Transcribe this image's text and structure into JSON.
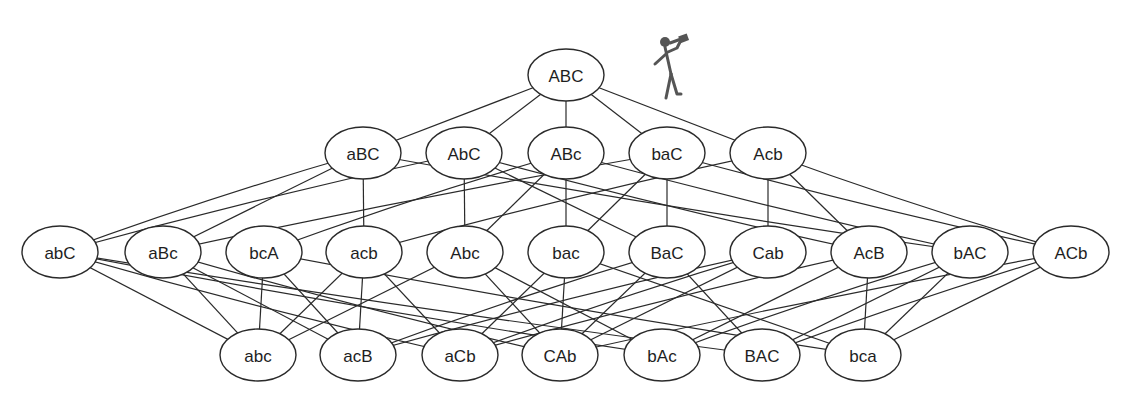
{
  "diagram": {
    "type": "lattice",
    "node_rx": 38,
    "node_ry": 26,
    "colors": {
      "stroke": "#2a2a2a",
      "fill": "#ffffff",
      "text": "#1e1e1e",
      "figure": "#555555"
    },
    "layers": [
      [
        {
          "id": "ABC",
          "label": "ABC",
          "x": 566,
          "y": 75
        }
      ],
      [
        {
          "id": "aBC",
          "label": "aBC",
          "x": 363,
          "y": 153
        },
        {
          "id": "AbC",
          "label": "AbC",
          "x": 464,
          "y": 153
        },
        {
          "id": "ABc",
          "label": "ABc",
          "x": 566,
          "y": 153
        },
        {
          "id": "baC",
          "label": "baC",
          "x": 667,
          "y": 153
        },
        {
          "id": "Acb",
          "label": "Acb",
          "x": 768,
          "y": 153
        }
      ],
      [
        {
          "id": "abC",
          "label": "abC",
          "x": 60,
          "y": 252
        },
        {
          "id": "aBc",
          "label": "aBc",
          "x": 163,
          "y": 252
        },
        {
          "id": "bcA",
          "label": "bcA",
          "x": 264,
          "y": 252
        },
        {
          "id": "acb",
          "label": "acb",
          "x": 364,
          "y": 252
        },
        {
          "id": "Abc",
          "label": "Abc",
          "x": 465,
          "y": 252
        },
        {
          "id": "bac",
          "label": "bac",
          "x": 566,
          "y": 252
        },
        {
          "id": "BaC",
          "label": "BaC",
          "x": 667,
          "y": 252
        },
        {
          "id": "Cab",
          "label": "Cab",
          "x": 768,
          "y": 252
        },
        {
          "id": "AcB",
          "label": "AcB",
          "x": 869,
          "y": 252
        },
        {
          "id": "bAC",
          "label": "bAC",
          "x": 970,
          "y": 252
        },
        {
          "id": "ACb",
          "label": "ACb",
          "x": 1071,
          "y": 252
        }
      ],
      [
        {
          "id": "abc",
          "label": "abc",
          "x": 258,
          "y": 355
        },
        {
          "id": "acB",
          "label": "acB",
          "x": 358,
          "y": 355
        },
        {
          "id": "aCb",
          "label": "aCb",
          "x": 460,
          "y": 355
        },
        {
          "id": "CAb",
          "label": "CAb",
          "x": 560,
          "y": 355
        },
        {
          "id": "bAc",
          "label": "bAc",
          "x": 662,
          "y": 355
        },
        {
          "id": "BAC",
          "label": "BAC",
          "x": 762,
          "y": 355
        },
        {
          "id": "bca",
          "label": "bca",
          "x": 863,
          "y": 355
        }
      ]
    ],
    "edges": [
      [
        "ABC",
        "aBC"
      ],
      [
        "ABC",
        "AbC"
      ],
      [
        "ABC",
        "ABc"
      ],
      [
        "ABC",
        "baC"
      ],
      [
        "ABC",
        "Acb"
      ],
      [
        "aBC",
        "abC"
      ],
      [
        "aBC",
        "aBc"
      ],
      [
        "aBC",
        "acb"
      ],
      [
        "aBC",
        "bAC"
      ],
      [
        "AbC",
        "abC"
      ],
      [
        "AbC",
        "Abc"
      ],
      [
        "AbC",
        "BaC"
      ],
      [
        "AbC",
        "AcB"
      ],
      [
        "ABc",
        "bcA"
      ],
      [
        "ABc",
        "Abc"
      ],
      [
        "ABc",
        "bac"
      ],
      [
        "ABc",
        "bAC"
      ],
      [
        "baC",
        "aBc"
      ],
      [
        "baC",
        "bac"
      ],
      [
        "baC",
        "BaC"
      ],
      [
        "baC",
        "ACb"
      ],
      [
        "Acb",
        "acb"
      ],
      [
        "Acb",
        "Cab"
      ],
      [
        "Acb",
        "AcB"
      ],
      [
        "Acb",
        "ACb"
      ],
      [
        "abC",
        "abc"
      ],
      [
        "abC",
        "aCb"
      ],
      [
        "abC",
        "bAc"
      ],
      [
        "abC",
        "BAC"
      ],
      [
        "aBc",
        "abc"
      ],
      [
        "aBc",
        "acB"
      ],
      [
        "aBc",
        "CAb"
      ],
      [
        "bcA",
        "abc"
      ],
      [
        "bcA",
        "acB"
      ],
      [
        "bcA",
        "bca"
      ],
      [
        "acb",
        "acB"
      ],
      [
        "acb",
        "aCb"
      ],
      [
        "acb",
        "abc"
      ],
      [
        "Abc",
        "abc"
      ],
      [
        "Abc",
        "CAb"
      ],
      [
        "Abc",
        "bAc"
      ],
      [
        "bac",
        "aCb"
      ],
      [
        "bac",
        "CAb"
      ],
      [
        "bac",
        "bca"
      ],
      [
        "BaC",
        "acB"
      ],
      [
        "BaC",
        "CAb"
      ],
      [
        "BaC",
        "BAC"
      ],
      [
        "Cab",
        "aCb"
      ],
      [
        "Cab",
        "acB"
      ],
      [
        "Cab",
        "CAb"
      ],
      [
        "AcB",
        "aCb"
      ],
      [
        "AcB",
        "bAc"
      ],
      [
        "AcB",
        "bca"
      ],
      [
        "bAC",
        "bAc"
      ],
      [
        "bAC",
        "BAC"
      ],
      [
        "bAC",
        "bca"
      ],
      [
        "ACb",
        "BAC"
      ],
      [
        "ACb",
        "bca"
      ],
      [
        "ACb",
        "CAb"
      ]
    ],
    "figure": {
      "description": "stick figure drinking from a bottle, standing on edge ABC-Acb",
      "x": 667,
      "y": 34
    }
  }
}
